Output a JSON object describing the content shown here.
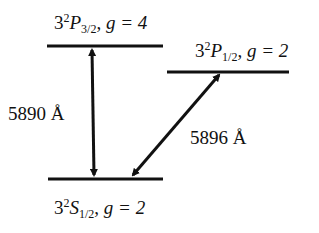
{
  "diagram": {
    "type": "energy-level-diagram",
    "levels": [
      {
        "id": "p32",
        "n": "3",
        "mult": "2",
        "L": "P",
        "J": "3/2",
        "g_label": "g = 4"
      },
      {
        "id": "p12",
        "n": "3",
        "mult": "2",
        "L": "P",
        "J": "1/2",
        "g_label": "g = 2"
      },
      {
        "id": "s12",
        "n": "3",
        "mult": "2",
        "L": "S",
        "J": "1/2",
        "g_label": "g = 2"
      }
    ],
    "transitions": [
      {
        "from": "p32",
        "to": "s12",
        "label": "5890 Å"
      },
      {
        "from": "p12",
        "to": "s12",
        "label": "5896 Å"
      }
    ],
    "color": "#111111"
  }
}
